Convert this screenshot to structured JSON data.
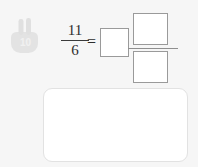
{
  "page": {
    "background_color": "#f6f6f6"
  },
  "question": {
    "number_badge": {
      "icon": "hand-badge-icon",
      "number": "10",
      "color": "#c9c9c9"
    },
    "given_fraction": {
      "numerator": "11",
      "denominator": "6",
      "bar": "fraction-bar"
    },
    "equals": "=",
    "answer": {
      "whole_box": {
        "value": "",
        "placeholder": ""
      },
      "numerator_box": {
        "value": "",
        "placeholder": ""
      },
      "denominator_box": {
        "value": "",
        "placeholder": ""
      },
      "box_border_color": "#9a9a9a"
    }
  },
  "work_area": {
    "value": "",
    "placeholder": "",
    "border_color": "#e2e2e2",
    "background_color": "#ffffff"
  }
}
